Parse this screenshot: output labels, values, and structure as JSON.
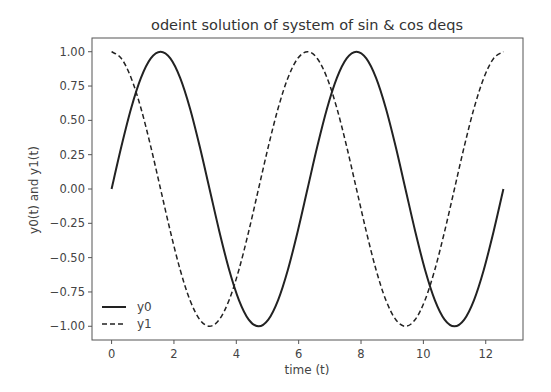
{
  "chart_data": {
    "type": "line",
    "title": "odeint solution of system of sin & cos deqs",
    "xlabel": "time (t)",
    "ylabel": "y0(t) and y1(t)",
    "xlim": [
      -0.628,
      13.195
    ],
    "ylim": [
      -1.1,
      1.1
    ],
    "xticks": [
      0,
      2,
      4,
      6,
      8,
      10,
      12
    ],
    "xtick_labels": [
      "0",
      "2",
      "4",
      "6",
      "8",
      "10",
      "12"
    ],
    "yticks": [
      1.0,
      0.75,
      0.5,
      0.25,
      0.0,
      -0.25,
      -0.5,
      -0.75,
      -1.0
    ],
    "ytick_labels": [
      "1.00",
      "0.75",
      "0.50",
      "0.25",
      "0.00",
      "−0.25",
      "−0.50",
      "−0.75",
      "−1.00"
    ],
    "grid": false,
    "legend_position": "lower left",
    "x": [
      0,
      0.314,
      0.628,
      0.942,
      1.257,
      1.571,
      1.885,
      2.199,
      2.513,
      2.827,
      3.142,
      3.456,
      3.77,
      4.084,
      4.398,
      4.712,
      5.027,
      5.341,
      5.655,
      5.969,
      6.283,
      6.597,
      6.912,
      7.226,
      7.54,
      7.854,
      8.168,
      8.482,
      8.796,
      9.111,
      9.425,
      9.739,
      10.053,
      10.367,
      10.681,
      10.996,
      11.31,
      11.624,
      11.938,
      12.252,
      12.566
    ],
    "series": [
      {
        "name": "y0",
        "style": "solid",
        "color": "#222222",
        "values": [
          0.0,
          0.309,
          0.588,
          0.809,
          0.951,
          1.0,
          0.951,
          0.809,
          0.588,
          0.309,
          0.0,
          -0.309,
          -0.588,
          -0.809,
          -0.951,
          -1.0,
          -0.951,
          -0.809,
          -0.588,
          -0.309,
          0.0,
          0.309,
          0.588,
          0.809,
          0.951,
          1.0,
          0.951,
          0.809,
          0.588,
          0.309,
          0.0,
          -0.309,
          -0.588,
          -0.809,
          -0.951,
          -1.0,
          -0.951,
          -0.809,
          -0.588,
          -0.309,
          0.0
        ]
      },
      {
        "name": "y1",
        "style": "dashed",
        "color": "#222222",
        "values": [
          1.0,
          0.951,
          0.809,
          0.588,
          0.309,
          0.0,
          -0.309,
          -0.588,
          -0.809,
          -0.951,
          -1.0,
          -0.951,
          -0.809,
          -0.588,
          -0.309,
          0.0,
          0.309,
          0.588,
          0.809,
          0.951,
          1.0,
          0.951,
          0.809,
          0.588,
          0.309,
          0.0,
          -0.309,
          -0.588,
          -0.809,
          -0.951,
          -1.0,
          -0.951,
          -0.809,
          -0.588,
          -0.309,
          0.0,
          0.309,
          0.588,
          0.809,
          0.951,
          1.0
        ]
      }
    ]
  },
  "legend": {
    "items": [
      {
        "label": "y0",
        "style": "solid"
      },
      {
        "label": "y1",
        "style": "dashed"
      }
    ]
  }
}
